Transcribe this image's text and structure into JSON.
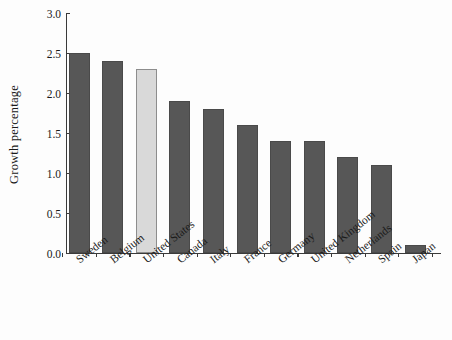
{
  "chart_data": {
    "type": "bar",
    "title": "",
    "xlabel": "",
    "ylabel": "Growth percentage",
    "categories": [
      "Sweden",
      "Belgium",
      "United States",
      "Canada",
      "Italy",
      "France",
      "Germany",
      "United Kingdom",
      "Netherlands",
      "Spain",
      "Japan"
    ],
    "values": [
      2.5,
      2.4,
      2.3,
      1.9,
      1.8,
      1.6,
      1.4,
      1.4,
      1.2,
      1.1,
      0.1
    ],
    "ylim": [
      0.0,
      3.0
    ],
    "ytick_labels": [
      "0.0",
      "0.5",
      "1.0",
      "1.5",
      "2.0",
      "2.5",
      "3.0"
    ],
    "ytick_values": [
      0.0,
      0.5,
      1.0,
      1.5,
      2.0,
      2.5,
      3.0
    ],
    "grid": false,
    "legend": "none",
    "highlight_category": "United States",
    "colors": {
      "bar": "#575757",
      "bar_edge": "#4a4a4a",
      "highlight_bar": "#d9d9d9",
      "highlight_bar_edge": "#8d8d8d",
      "axis": "#3a3a3a",
      "background": "#fdfdfd",
      "text": "#1a1a1a"
    }
  }
}
